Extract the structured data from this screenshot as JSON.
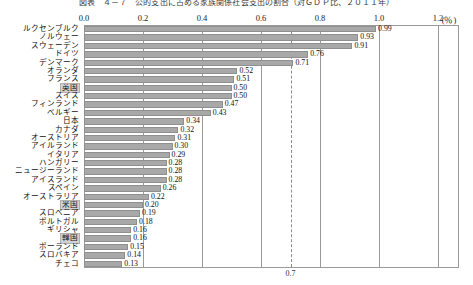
{
  "chart_data": {
    "type": "bar",
    "orientation": "horizontal",
    "title": "図表　４－７　公的支出に占める家族関係社会支出の割合（対ＧＤＰ比、２０１１年）",
    "xlabel": "",
    "ylabel": "",
    "unit_label": "(％)",
    "xlim": [
      0.0,
      1.2
    ],
    "xticks": [
      "0.0",
      "0.2",
      "0.4",
      "0.6",
      "0.8",
      "1.0",
      "1.2"
    ],
    "xtick_values": [
      0.0,
      0.2,
      0.4,
      0.6,
      0.8,
      1.0,
      1.2
    ],
    "grid": true,
    "legend": "none",
    "reference_line": {
      "value": 0.7,
      "label": "0.7",
      "style": "dashed"
    },
    "highlighted_categories": [
      "英国",
      "米国",
      "韓国"
    ],
    "bar_color": "#a8a8a8",
    "categories": [
      "ルクセンブルク",
      "ノルウェー",
      "スウェーデン",
      "ドイツ",
      "デンマーク",
      "オランダ",
      "フランス",
      "英国",
      "スイス",
      "フィンランド",
      "ベルギー",
      "日本",
      "カナダ",
      "オーストリア",
      "アイルランド",
      "イタリア",
      "ハンガリー",
      "ニュージーランド",
      "アイスランド",
      "スペイン",
      "オーストラリア",
      "米国",
      "スロベニア",
      "ポルトガル",
      "ギリシャ",
      "韓国",
      "ポーランド",
      "スロバキア",
      "チェコ"
    ],
    "values": [
      0.99,
      0.93,
      0.91,
      0.76,
      0.71,
      0.52,
      0.51,
      0.5,
      0.5,
      0.47,
      0.43,
      0.34,
      0.32,
      0.31,
      0.3,
      0.29,
      0.28,
      0.28,
      0.28,
      0.26,
      0.22,
      0.2,
      0.19,
      0.18,
      0.16,
      0.16,
      0.15,
      0.14,
      0.13
    ],
    "value_labels": [
      "0.99",
      "0.93",
      "0.91",
      "0.76",
      "0.71",
      "0.52",
      "0.51",
      "0.50",
      "0.50",
      "0.47",
      "0.43",
      "0.34",
      "0.32",
      "0.31",
      "0.30",
      "0.29",
      "0.28",
      "0.28",
      "0.28",
      "0.26",
      "0.22",
      "0.20",
      "0.19",
      "0.18",
      "0.16",
      "0.16",
      "0.15",
      "0.14",
      "0.13"
    ]
  }
}
